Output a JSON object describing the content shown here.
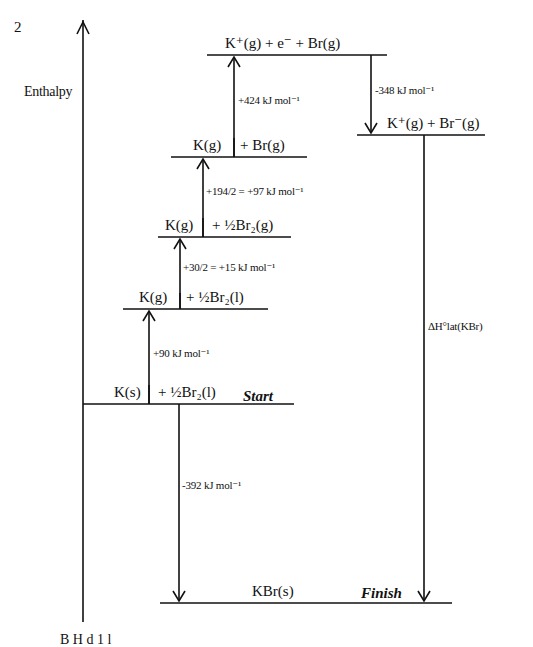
{
  "question_number": "2",
  "axis": {
    "label": "Enthalpy"
  },
  "levels": {
    "start": {
      "left": "K(s)",
      "right": "+ ½Br₂(l)",
      "tag": "Start"
    },
    "k_gas_br_liquid": {
      "left": "K(g)",
      "right": "+ ½Br₂(l)"
    },
    "k_gas_br2_gas": {
      "left": "K(g)",
      "right": "+ ½Br₂(g)"
    },
    "k_gas_br_gas": {
      "left": "K(g)",
      "right": "+ Br(g)"
    },
    "ions_electron": {
      "text": "K⁺(g)  +  e⁻  + Br(g)"
    },
    "ion_pair": {
      "text": "K⁺(g) + Br⁻(g)"
    },
    "finish": {
      "text": "KBr(s)",
      "tag": "Finish"
    }
  },
  "steps": {
    "atomisation_k": "+90 kJ mol⁻¹",
    "vaporisation_br": "+30/2 = +15 kJ mol⁻¹",
    "atomisation_br": "+194/2 = +97 kJ mol⁻¹",
    "ionisation_k": "+424 kJ mol⁻¹",
    "electron_affinity_br": "-348 kJ mol⁻¹",
    "formation_kbr": "-392 kJ mol⁻¹",
    "lattice_enthalpy": "ΔH°lat(KBr)"
  },
  "footer_partial": "B  H  d  1  l"
}
